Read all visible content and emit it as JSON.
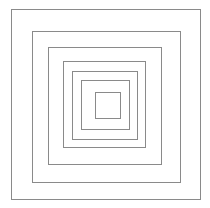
{
  "drawing": {
    "description": "Seven concentric nested squares line drawing",
    "background_color": "#ffffff",
    "line_color": "#8a8a8a",
    "line_width_px": 1,
    "canvas": {
      "width": 210,
      "height": 208
    },
    "squares": [
      {
        "name": "square-1-outermost",
        "left": 11,
        "top": 9,
        "width": 190,
        "height": 191
      },
      {
        "name": "square-2",
        "left": 32,
        "top": 31,
        "width": 149,
        "height": 152
      },
      {
        "name": "square-3",
        "left": 48,
        "top": 47,
        "width": 114,
        "height": 118
      },
      {
        "name": "square-4",
        "left": 63,
        "top": 61,
        "width": 83,
        "height": 87
      },
      {
        "name": "square-5",
        "left": 72,
        "top": 71,
        "width": 66,
        "height": 69
      },
      {
        "name": "square-6",
        "left": 81,
        "top": 80,
        "width": 49,
        "height": 50
      },
      {
        "name": "square-7-innermost",
        "left": 95,
        "top": 92,
        "width": 26,
        "height": 27
      }
    ]
  }
}
